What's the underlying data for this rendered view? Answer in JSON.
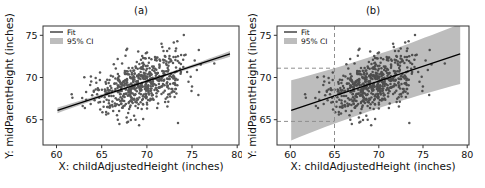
{
  "figure": {
    "background": "#ffffff",
    "colors": {
      "point": "#3b3b3b",
      "fit_line": "#000000",
      "ci_band": "#bdbdbd",
      "guide": "#8f8f8f",
      "frame": "#333333",
      "text": "#111111"
    }
  },
  "render": {
    "seed": 1847,
    "point_radius": 1.25,
    "point_opacity": 0.85
  },
  "chart_data": [
    {
      "type": "scatter",
      "panel": "a",
      "title": "(a)",
      "xlabel": "X: childAdjustedHeight (inches)",
      "ylabel": "Y: midParentHeight (inches)",
      "x_ticks": [
        60,
        65,
        70,
        75,
        80
      ],
      "y_ticks": [
        65,
        70,
        75
      ],
      "xlim": [
        58.5,
        80.2
      ],
      "ylim": [
        62.0,
        76.1
      ],
      "grid": false,
      "legend": {
        "position": "top-left",
        "entries": [
          {
            "label": "Fit",
            "marker": "line"
          },
          {
            "label": "95% CI",
            "marker": "band"
          }
        ]
      },
      "fit_line": {
        "slope": 0.35,
        "intercept": 45.07,
        "x_start": 60.1,
        "x_end": 79.2
      },
      "ci_band": {
        "kind": "confidence",
        "half_width_center": 0.15,
        "half_width_edge": 0.34
      },
      "scatter_summary": {
        "n_points": 620,
        "x_mean": 69.3,
        "x_sd": 2.6,
        "residual_sd": 1.6,
        "x_min": 60.1,
        "x_max": 79.3,
        "y_min": 62.9,
        "y_max": 75.5
      }
    },
    {
      "type": "scatter",
      "panel": "b",
      "title": "(b)",
      "xlabel": "X: childAdjustedHeight (inches)",
      "ylabel": "Y: midParentHeight (inches)",
      "x_ticks": [
        60,
        65,
        70,
        75,
        80
      ],
      "y_ticks": [
        65,
        70,
        75
      ],
      "xlim": [
        58.5,
        80.2
      ],
      "ylim": [
        62.0,
        76.1
      ],
      "grid": false,
      "legend": {
        "position": "top-left",
        "entries": [
          {
            "label": "Fit",
            "marker": "line"
          },
          {
            "label": "95% CI",
            "marker": "band"
          }
        ]
      },
      "fit_line": {
        "slope": 0.35,
        "intercept": 45.07,
        "x_start": 60.1,
        "x_end": 79.2
      },
      "ci_band": {
        "kind": "prediction",
        "half_width_center": 3.2,
        "half_width_edge": 3.56
      },
      "guides": {
        "x": 65,
        "y_upper": 71.1,
        "y_lower": 64.8,
        "style": "dashed"
      },
      "scatter": "same-points-as-panel-a"
    }
  ]
}
